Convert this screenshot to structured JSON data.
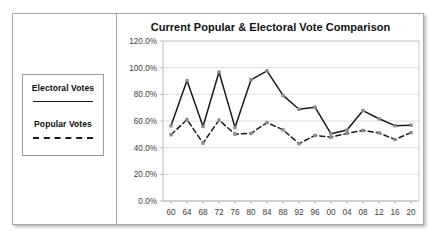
{
  "legend": {
    "entries": [
      {
        "label": "Electoral Votes",
        "style": "solid",
        "color": "#1a1a1a"
      },
      {
        "label": "Popular Votes",
        "style": "dashed",
        "color": "#1a1a1a"
      }
    ]
  },
  "chart_data": {
    "type": "line",
    "title": "Current Popular & Electoral Vote Comparison",
    "xlabel": "",
    "ylabel": "",
    "ylim": [
      0,
      120
    ],
    "ytick_labels": [
      "0.0%",
      "20.0%",
      "40.0%",
      "60.0%",
      "80.0%",
      "100.0%",
      "120.0%"
    ],
    "ytick_values": [
      0,
      20,
      40,
      60,
      80,
      100,
      120
    ],
    "grid": "horizontal",
    "legend_position": "left-panel",
    "categories": [
      "60",
      "64",
      "68",
      "72",
      "76",
      "80",
      "84",
      "88",
      "92",
      "96",
      "00",
      "04",
      "08",
      "12",
      "16",
      "20"
    ],
    "series": [
      {
        "name": "Electoral Votes",
        "style": "solid",
        "color": "#1a1a1a",
        "marker_color": "#8c8c8c",
        "values": [
          56.4,
          90.3,
          55.9,
          96.7,
          55.2,
          90.9,
          97.6,
          79.2,
          68.8,
          70.4,
          50.4,
          53.2,
          67.8,
          61.7,
          56.5,
          56.9
        ]
      },
      {
        "name": "Popular Votes",
        "style": "dashed",
        "color": "#1a1a1a",
        "marker_color": "#8c8c8c",
        "values": [
          49.7,
          61.1,
          43.4,
          60.7,
          50.1,
          50.7,
          58.8,
          53.4,
          43.0,
          49.2,
          47.9,
          50.7,
          52.9,
          51.1,
          46.1,
          51.3
        ]
      }
    ]
  }
}
